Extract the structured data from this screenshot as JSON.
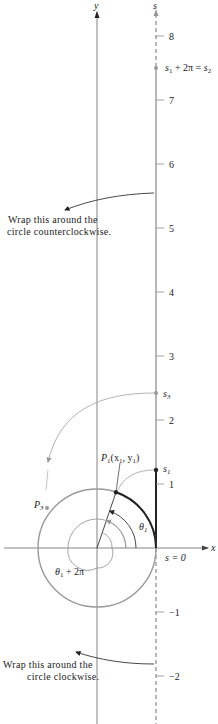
{
  "figure": {
    "axes": {
      "x_label": "x",
      "y_label": "y",
      "s_label": "s"
    },
    "s_axis_ticks": [
      "8",
      "7",
      "6",
      "5",
      "4",
      "3",
      "2",
      "1",
      "−1",
      "−2"
    ],
    "points": {
      "s_origin": "s = 0",
      "s1": "s",
      "s1_sub": "1",
      "s2_a": "s",
      "s2_a_sub": "1",
      "s2_mid": " + 2π = ",
      "s2_b": "s",
      "s2_b_sub": "2",
      "s3": "s",
      "s3_sub": "3",
      "p1_a": "P",
      "p1_a_sub": "1",
      "p1_b": "(x",
      "p1_b_sub": "1",
      "p1_c": ", y",
      "p1_c_sub": "1",
      "p1_d": ")",
      "p3": "P",
      "p3_sub": "3"
    },
    "angles": {
      "theta1": "θ",
      "theta1_sub": "1",
      "theta1_2pi": "θ",
      "theta1_2pi_sub": "1",
      "theta1_2pi_rest": " + 2π"
    },
    "annotations": {
      "ccw_line1": "Wrap this around the",
      "ccw_line2": "circle counterclockwise.",
      "cw_line1": "Wrap this around the",
      "cw_line2": "circle clockwise."
    },
    "colors": {
      "gray_line": "#9a9a9a",
      "dark_line": "#222222",
      "thin_axis": "#555555"
    }
  }
}
